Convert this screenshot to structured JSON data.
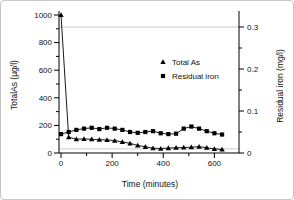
{
  "figure": {
    "background": "#ffffff",
    "border_color": "#c6c6c6",
    "axis_color": "#000000",
    "reference_line_color": "#cccccc"
  },
  "chart_data": {
    "type": "line",
    "title": "",
    "xlabel": "Time (minutes)",
    "ylabel_left": "TotalAs (µg/l)",
    "ylabel_right": "Residual iron (mg/l)",
    "x_axis": {
      "ticks": [
        0,
        200,
        400,
        600
      ],
      "tick_labels": [
        "0",
        "200",
        "400",
        "600"
      ],
      "minor_ticks": [
        100,
        300,
        500
      ],
      "range": [
        -10,
        700
      ]
    },
    "left_axis": {
      "ticks": [
        0,
        200,
        400,
        600,
        800,
        1000
      ],
      "tick_labels": [
        "0",
        "200",
        "400",
        "600",
        "800",
        "1000"
      ],
      "minor_ticks": [
        100,
        300,
        500,
        700,
        900
      ],
      "range": [
        0,
        1000
      ]
    },
    "right_axis": {
      "ticks": [
        0,
        0.1,
        0.2,
        0.3
      ],
      "tick_labels": [
        "0",
        "0.1",
        "0.2",
        "0.3"
      ],
      "minor_ticks": [
        0.05,
        0.15,
        0.25
      ],
      "range": [
        0,
        0.34
      ]
    },
    "reference_lines": [
      {
        "axis": "right",
        "value": 0.3
      },
      {
        "axis": "left",
        "value": 30
      }
    ],
    "x": [
      0,
      30,
      60,
      90,
      120,
      150,
      180,
      210,
      240,
      270,
      300,
      330,
      360,
      390,
      420,
      450,
      480,
      510,
      540,
      570,
      600,
      630
    ],
    "series": [
      {
        "name": "Total As",
        "axis": "left",
        "marker": "triangle",
        "color": "#000000",
        "values": [
          1000,
          115,
          100,
          102,
          100,
          96,
          95,
          90,
          80,
          70,
          55,
          45,
          35,
          32,
          36,
          38,
          40,
          42,
          46,
          38,
          30,
          26
        ]
      },
      {
        "name": "Residual iron",
        "axis": "right",
        "marker": "square",
        "color": "#000000",
        "values": [
          0.045,
          0.05,
          0.055,
          0.058,
          0.06,
          0.057,
          0.06,
          0.058,
          0.055,
          0.05,
          0.048,
          0.05,
          0.052,
          0.047,
          0.045,
          0.046,
          0.058,
          0.063,
          0.058,
          0.052,
          0.047,
          0.044
        ]
      }
    ],
    "legend": {
      "position": "middle-right-inside",
      "items": [
        "Total As",
        "Residual iron"
      ]
    }
  }
}
